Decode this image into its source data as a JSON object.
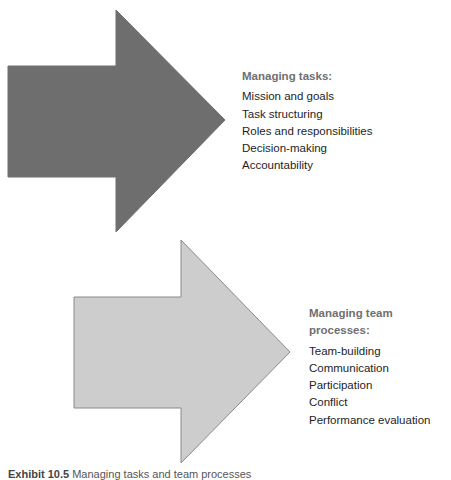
{
  "diagram": {
    "arrows": [
      {
        "name": "tasks-arrow",
        "fill": "#6e6e6e",
        "stroke": "#6e6e6e",
        "points": "8,66 116,66 116,10 225,120 116,232 116,177 8,177"
      },
      {
        "name": "team-processes-arrow",
        "fill": "#cdcdcd",
        "stroke": "#8a8a8a",
        "points": "74,297 181,297 181,240 290,352 181,463 181,408 74,408"
      }
    ],
    "tasks": {
      "heading": "Managing tasks:",
      "items": [
        "Mission and goals",
        "Task structuring",
        "Roles and responsibilities",
        "Decision-making",
        "Accountability"
      ]
    },
    "team_processes": {
      "heading": "Managing team processes:",
      "items": [
        "Team-building",
        "Communication",
        "Participation",
        "Conflict",
        "Performance evaluation"
      ]
    },
    "caption": {
      "label": "Exhibit 10.5",
      "text": "Managing tasks and team processes"
    }
  }
}
